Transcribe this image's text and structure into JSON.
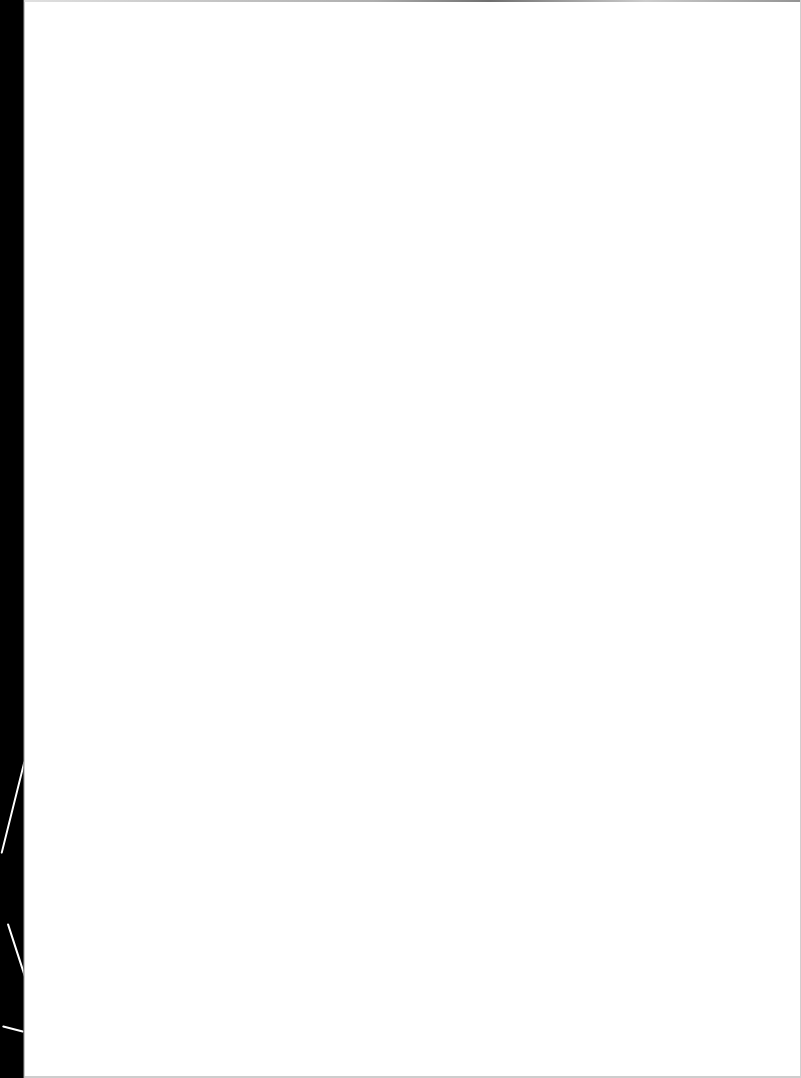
{
  "document": {
    "type": "scanned-page",
    "page_text": "",
    "background_color": "#ffffff",
    "scanner_margin_color": "#000000"
  }
}
